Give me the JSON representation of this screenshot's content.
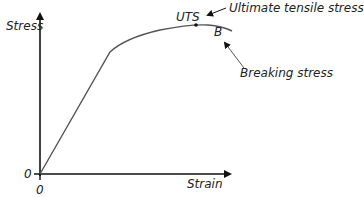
{
  "axes": {
    "y_label": "Stress",
    "x_label": "Strain",
    "y_origin": "0",
    "x_origin": "0"
  },
  "points": {
    "uts_label": "UTS",
    "breaking_label": "B"
  },
  "annotations": {
    "uts": "Ultimate tensile stress",
    "breaking": "Breaking stress"
  },
  "colors": {
    "axis": "#111111",
    "curve": "#555555",
    "text": "#222222"
  }
}
